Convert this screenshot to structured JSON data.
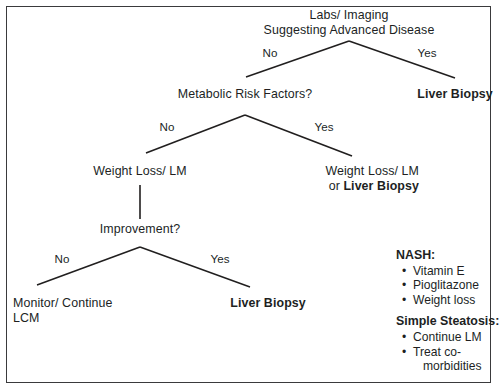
{
  "figure": {
    "title": "Labs/ Imaging Suggesting Advanced Disease",
    "border_color": "#3a3a3c",
    "text_color": "#211f1f",
    "background": "#ffffff"
  },
  "nodes": {
    "root_line1": "Labs/ Imaging",
    "root_line2": "Suggesting Advanced Disease",
    "metabolic_risk": "Metabolic Risk Factors?",
    "liver_biopsy_top": "Liver Biopsy",
    "weight_loss_left": "Weight Loss/ LM",
    "weight_loss_right": "Weight Loss/ LM",
    "or_word": "or ",
    "liver_biopsy_right": "Liver Biopsy",
    "improvement": "Improvement?",
    "monitor_line1": "Monitor/ Continue",
    "monitor_line2": "LCM",
    "liver_biopsy_bottom": "Liver Biopsy"
  },
  "edges": {
    "root_no": "No",
    "root_yes": "Yes",
    "metabolic_no": "No",
    "metabolic_yes": "Yes",
    "improvement_no": "No",
    "improvement_yes": "Yes"
  },
  "legend": {
    "nash_heading": "NASH:",
    "nash_items": [
      "Vitamin E",
      "Pioglitazone",
      "Weight loss"
    ],
    "steatosis_heading": "Simple Steatosis:",
    "steatosis_items": [
      "Continue LM"
    ],
    "steatosis_item_wrapped": {
      "line1": "Treat co-",
      "line2": "morbidities"
    },
    "bullet_glyph": "•"
  }
}
